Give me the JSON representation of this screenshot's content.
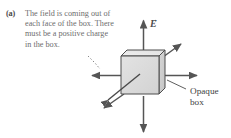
{
  "figure": {
    "panel_label": "(a)",
    "caption": "The field is coming out of each face of the box. There must be a positive charge in the box.",
    "caption_lines": [
      "The field is coming",
      "out of each face of",
      "the box. There must",
      "be a positive charge",
      "in the box."
    ],
    "field_label": "E",
    "field_label_accent": "→",
    "object_label_line1": "Opaque",
    "object_label_line2": "box",
    "colors": {
      "caption_text": "#6e6e6e",
      "label_text": "#3f3f3f",
      "arrow": "#555555",
      "cube_stroke": "#4d4d4d",
      "cube_face_front": "#dcdcdc",
      "cube_face_top": "#eaeaea",
      "cube_face_right": "#cfcfcf",
      "background": "#ffffff"
    },
    "icons": {
      "field_arrow_up": "arrow-up-icon",
      "field_arrow_down": "arrow-down-icon",
      "field_arrow_left": "arrow-left-icon",
      "field_arrow_right": "arrow-right-icon",
      "field_arrow_upper_right": "arrow-upper-right-icon",
      "field_arrow_lower_left": "arrow-lower-left-icon",
      "charge_pointer": "charge-pointer-arrow-icon",
      "cube": "cube-icon",
      "leader_dotted": "dotted-leader-icon",
      "leader_solid": "solid-leader-icon"
    }
  }
}
